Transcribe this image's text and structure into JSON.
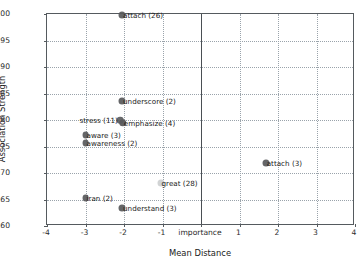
{
  "chart_data": {
    "type": "scatter",
    "title": "",
    "xlabel": "Mean Distance",
    "ylabel": "Association Strength",
    "xlim": [
      -4,
      4
    ],
    "ylim": [
      0.6,
      1.0
    ],
    "grid": true,
    "legend": null,
    "xticks": [
      -4,
      -3,
      -2,
      -1,
      0,
      1,
      2,
      3,
      4
    ],
    "xtick_labels": [
      "-4",
      "-3",
      "-2",
      "-1",
      "importance",
      "1",
      "2",
      "3",
      "4"
    ],
    "yticks": [
      0.6,
      0.65,
      0.7,
      0.75,
      0.8,
      0.85,
      0.9,
      0.95,
      1.0
    ],
    "ytick_labels": [
      "0.60",
      "0.65",
      "0.70",
      "0.75",
      "0.80",
      "0.85",
      "0.90",
      "0.95",
      "1.00"
    ],
    "annotations": [
      {
        "text": "importance",
        "x": 0,
        "y": 0.6,
        "kind": "x-axis-origin-label"
      }
    ],
    "vertical_reference_line": {
      "x": 0,
      "color": "#4a4f54"
    },
    "marker_color": "#58595b",
    "points": [
      {
        "label": "attach (26)",
        "word": "attach",
        "count": 26,
        "x": -2.05,
        "y": 0.998,
        "size": 7.0,
        "color": "#58595b",
        "opacity": 0.92,
        "label_side": "right"
      },
      {
        "label": "underscore (2)",
        "word": "underscore",
        "count": 2,
        "x": -2.05,
        "y": 0.835,
        "size": 7.0,
        "color": "#58595b",
        "opacity": 0.92,
        "label_side": "right"
      },
      {
        "label": "emphasize (4)",
        "word": "emphasize",
        "count": 4,
        "x": -2.03,
        "y": 0.795,
        "size": 7.6,
        "color": "#58595b",
        "opacity": 0.95,
        "label_side": "right"
      },
      {
        "label": "stress (11)",
        "word": "stress",
        "count": 11,
        "x": -2.1,
        "y": 0.8,
        "size": 6.6,
        "color": "#58595b",
        "opacity": 0.9,
        "label_side": "left"
      },
      {
        "label": "aware (3)",
        "word": "aware",
        "count": 3,
        "x": -3.0,
        "y": 0.772,
        "size": 6.8,
        "color": "#58595b",
        "opacity": 0.92,
        "label_side": "right"
      },
      {
        "label": "awareness (2)",
        "word": "awareness",
        "count": 2,
        "x": -3.0,
        "y": 0.757,
        "size": 6.8,
        "color": "#58595b",
        "opacity": 0.92,
        "label_side": "right"
      },
      {
        "label": "attach (3)",
        "word": "attach",
        "count": 3,
        "x": 1.68,
        "y": 0.718,
        "size": 7.0,
        "color": "#58595b",
        "opacity": 0.92,
        "label_side": "right"
      },
      {
        "label": "great (28)",
        "word": "great",
        "count": 28,
        "x": -1.05,
        "y": 0.682,
        "size": 7.0,
        "color": "#c9cbcd",
        "opacity": 0.85,
        "label_side": "right"
      },
      {
        "label": "iran (2)",
        "word": "iran",
        "count": 2,
        "x": -3.0,
        "y": 0.653,
        "size": 6.8,
        "color": "#58595b",
        "opacity": 0.92,
        "label_side": "right"
      },
      {
        "label": "understand (3)",
        "word": "understand",
        "count": 3,
        "x": -2.05,
        "y": 0.634,
        "size": 7.0,
        "color": "#58595b",
        "opacity": 0.92,
        "label_side": "right"
      }
    ]
  }
}
